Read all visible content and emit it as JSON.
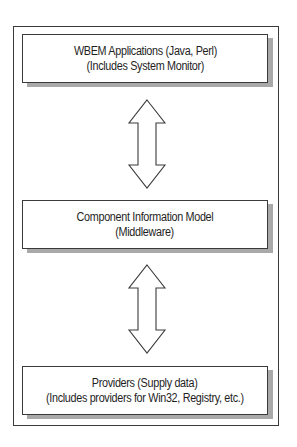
{
  "diagram": {
    "frame": {
      "border_color": "#3a3a3a",
      "shadow_color": "#a9a9a9"
    },
    "layers": [
      {
        "id": "wbem-applications",
        "line1": "WBEM Applications (Java, Perl)",
        "line2": "(Includes System Monitor)"
      },
      {
        "id": "component-information-model",
        "line1": "Component Information Model",
        "line2": "(Middleware)"
      },
      {
        "id": "providers",
        "line1": "Providers (Supply data)",
        "line2": "(Includes providers for Win32, Registry, etc.)"
      }
    ],
    "connectors": [
      {
        "from": "wbem-applications",
        "to": "component-information-model",
        "type": "bidirectional-arrow"
      },
      {
        "from": "component-information-model",
        "to": "providers",
        "type": "bidirectional-arrow"
      }
    ]
  }
}
